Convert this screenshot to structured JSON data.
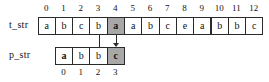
{
  "figure": {
    "text_row": {
      "label": "t_str",
      "indices": [
        "0",
        "1",
        "2",
        "3",
        "4",
        "5",
        "6",
        "7",
        "8",
        "9",
        "10",
        "11",
        "12"
      ],
      "cells": [
        "a",
        "b",
        "c",
        "b",
        "a",
        "a",
        "b",
        "c",
        "e",
        "a",
        "b",
        "b",
        "c"
      ],
      "highlighted_index": 4,
      "index_position": "above"
    },
    "pattern_row": {
      "label": "p_str",
      "indices": [
        "0",
        "1",
        "2",
        "3"
      ],
      "cells": [
        "a",
        "b",
        "b",
        "c"
      ],
      "highlighted_index": 3,
      "bold_index": 0,
      "index_position": "below",
      "aligned_under_text_index": 1
    },
    "connectors": [
      {
        "name": "match-line",
        "from_text_index": 3,
        "to_pattern_index": 2,
        "arrow": false
      },
      {
        "name": "mismatch-arrow",
        "from_text_index": 4,
        "to_pattern_index": 3,
        "arrow": true
      }
    ],
    "colors": {
      "highlight": "#a8a8a8",
      "border": "#2b2b2b",
      "background": "#ffffff",
      "text": "#111111"
    }
  }
}
